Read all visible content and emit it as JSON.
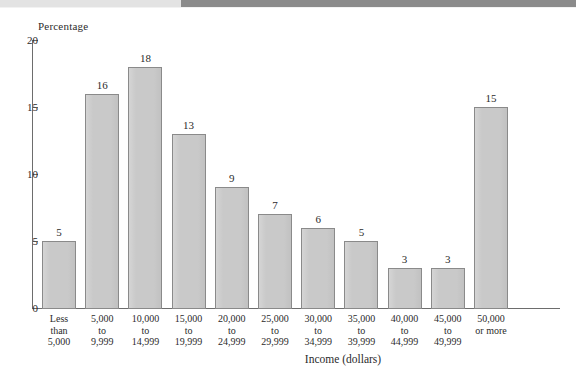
{
  "figure": {
    "y_axis_title": "Percentage",
    "x_axis_title": "Income (dollars)",
    "source_note": ""
  },
  "bands": {
    "left_color": "#e3e3e3",
    "right_color": "#8b8b8b"
  },
  "colors": {
    "bar_fill": "#c9c9c9",
    "bar_border": "#8a8a8a",
    "axis": "#6d6d6d",
    "text": "#2b2b2b"
  },
  "chart_data": {
    "type": "bar",
    "title": "",
    "subtitle": "",
    "xlabel": "Income (dollars)",
    "ylabel": "Percentage",
    "ylim": [
      0,
      20
    ],
    "yticks": [
      0,
      5,
      10,
      15,
      20
    ],
    "ytick_labels": [
      "0",
      "5",
      "10",
      "15",
      "20"
    ],
    "grid": false,
    "legend": null,
    "categories": [
      "Less\nthan\n5,000",
      "5,000\nto\n9,999",
      "10,000\nto\n14,999",
      "15,000\nto\n19,999",
      "20,000\nto\n24,999",
      "25,000\nto\n29,999",
      "30,000\nto\n34,999",
      "35,000\nto\n39,999",
      "40,000\nto\n44,999",
      "45,000\nto\n49,999",
      "50,000\nor more"
    ],
    "values": [
      5,
      16,
      18,
      13,
      9,
      7,
      6,
      5,
      3,
      3,
      15
    ],
    "value_labels": [
      "5",
      "16",
      "18",
      "13",
      "9",
      "7",
      "6",
      "5",
      "3",
      "3",
      "15"
    ]
  }
}
